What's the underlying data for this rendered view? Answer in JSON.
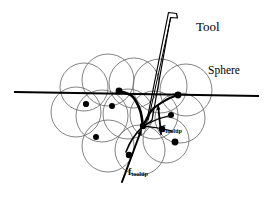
{
  "figure": {
    "background_color": "#ffffff",
    "ink_color": "#000000",
    "circle_stroke_color": "#6b6b6b",
    "labels": {
      "tool": "Tool",
      "sphere": "Sphere",
      "force_symbol": "f",
      "force_subscript": "tooltip"
    }
  },
  "chart_data": {
    "type": "diagram",
    "title": "",
    "view_box": [
      0,
      0,
      272,
      198
    ],
    "surface_line": {
      "label": "",
      "x1": 15,
      "y1": 92,
      "x2": 258,
      "y2": 96,
      "stroke_width": 2.0
    },
    "tool": {
      "label": "Tool",
      "tip_x": 146,
      "tip_y": 124,
      "top_x": 172,
      "top_y": 12,
      "stroke_width": 1.2,
      "outline": [
        [
          168.5,
          12.5
        ],
        [
          176.5,
          13.5
        ],
        [
          177.5,
          18.0
        ],
        [
          170.5,
          17.5
        ],
        [
          152.0,
          120.0
        ],
        [
          146.5,
          124.5
        ],
        [
          147.5,
          117.5
        ]
      ],
      "inner_line": [
        [
          170.8,
          17.6
        ],
        [
          148.2,
          120.5
        ]
      ]
    },
    "spheres": [
      {
        "cx": 84,
        "cy": 87,
        "r": 24
      },
      {
        "cx": 108,
        "cy": 80,
        "r": 26
      },
      {
        "cx": 134,
        "cy": 83,
        "r": 25
      },
      {
        "cx": 160,
        "cy": 86,
        "r": 27
      },
      {
        "cx": 186,
        "cy": 90,
        "r": 26
      },
      {
        "cx": 76,
        "cy": 112,
        "r": 25
      },
      {
        "cx": 102,
        "cy": 116,
        "r": 26
      },
      {
        "cx": 128,
        "cy": 114,
        "r": 25
      },
      {
        "cx": 154,
        "cy": 115,
        "r": 24
      },
      {
        "cx": 180,
        "cy": 118,
        "r": 25
      },
      {
        "cx": 108,
        "cy": 146,
        "r": 26
      },
      {
        "cx": 140,
        "cy": 150,
        "r": 25
      },
      {
        "cx": 166,
        "cy": 140,
        "r": 23
      }
    ],
    "sphere_centers_marked": [
      {
        "cx": 119,
        "cy": 91,
        "r": 3.4
      },
      {
        "cx": 86,
        "cy": 104,
        "r": 3.1
      },
      {
        "cx": 112,
        "cy": 106,
        "r": 3.0
      },
      {
        "cx": 178,
        "cy": 95,
        "r": 3.4
      },
      {
        "cx": 171,
        "cy": 115,
        "r": 3.0
      },
      {
        "cx": 162,
        "cy": 129,
        "r": 3.2
      },
      {
        "cx": 175,
        "cy": 142,
        "r": 3.4
      },
      {
        "cx": 96,
        "cy": 137,
        "r": 3.0
      },
      {
        "cx": 129,
        "cy": 155,
        "r": 3.2
      },
      {
        "cx": 143,
        "cy": 126,
        "r": 3.2
      }
    ],
    "deformation_curves": [
      {
        "name": "upper-left-sweep",
        "path": [
          [
            119,
            91
          ],
          [
            132,
            96
          ],
          [
            140,
            110
          ],
          [
            143,
            126
          ]
        ],
        "stroke_width": 2.6
      },
      {
        "name": "upper-right-sweep",
        "path": [
          [
            178,
            95
          ],
          [
            166,
            100
          ],
          [
            152,
            110
          ],
          [
            143,
            126
          ]
        ],
        "stroke_width": 2.2
      },
      {
        "name": "lower-left-branch",
        "path": [
          [
            143,
            126
          ],
          [
            136,
            134
          ],
          [
            130,
            143
          ],
          [
            126,
            152
          ]
        ],
        "stroke_width": 1.6
      },
      {
        "name": "right-fan-upper",
        "path": [
          [
            143,
            126
          ],
          [
            156,
            120
          ],
          [
            168,
            116
          ]
        ],
        "stroke_width": 1.2
      },
      {
        "name": "right-fan-lower",
        "path": [
          [
            143,
            126
          ],
          [
            158,
            128
          ],
          [
            172,
            131
          ]
        ],
        "stroke_width": 1.2
      }
    ],
    "force_vectors": [
      {
        "label": "f_tooltip",
        "name": "lower-tooltip-force",
        "x1": 122,
        "y1": 182,
        "x2": 142,
        "y2": 128,
        "arrow_size": 7.5,
        "stroke_width": 2.0
      },
      {
        "label": "f_tooltip",
        "name": "upper-tooltip-force",
        "x1": 161,
        "y1": 134,
        "x2": 158,
        "y2": 104,
        "arrow_size": 6.0,
        "stroke_width": 1.8
      }
    ],
    "annotations": [
      {
        "text": "Tool",
        "x": 196,
        "y": 20
      },
      {
        "text": "Sphere",
        "x": 208,
        "y": 65
      }
    ],
    "grid": false,
    "legend": "none"
  }
}
